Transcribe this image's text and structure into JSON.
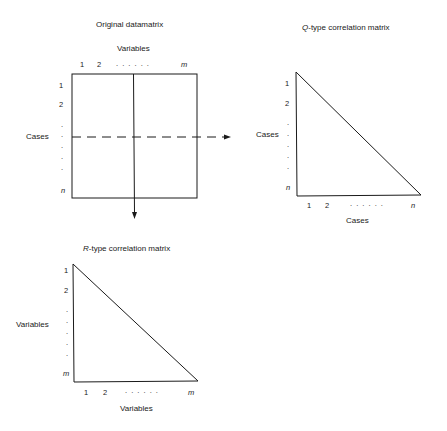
{
  "original": {
    "title": "Original datamatrix",
    "col_header": "Variables",
    "row_header": "Cases",
    "col_ticks": [
      "1",
      "2",
      ". . . . . .",
      "m"
    ],
    "row_ticks": [
      "1",
      "2",
      ".",
      ".",
      ".",
      ".",
      ".",
      "n"
    ]
  },
  "q_matrix": {
    "title_prefix": "Q",
    "title_rest": "-type correlation matrix",
    "row_header": "Cases",
    "col_header": "Cases",
    "row_ticks": [
      "1",
      "2",
      ".",
      ".",
      ".",
      ".",
      ".",
      "n"
    ],
    "col_ticks": [
      "1",
      "2",
      ". . . . . .",
      "n"
    ]
  },
  "r_matrix": {
    "title_prefix": "R",
    "title_rest": "-type correlation matrix",
    "row_header": "Variables",
    "col_header": "Variables",
    "row_ticks": [
      "1",
      "2",
      ".",
      ".",
      ".",
      ".",
      ".",
      "m"
    ],
    "col_ticks": [
      "1",
      "2",
      ". . . . . .",
      "m"
    ]
  },
  "colors": {
    "line": "#1a1a1a",
    "background": "#ffffff"
  }
}
